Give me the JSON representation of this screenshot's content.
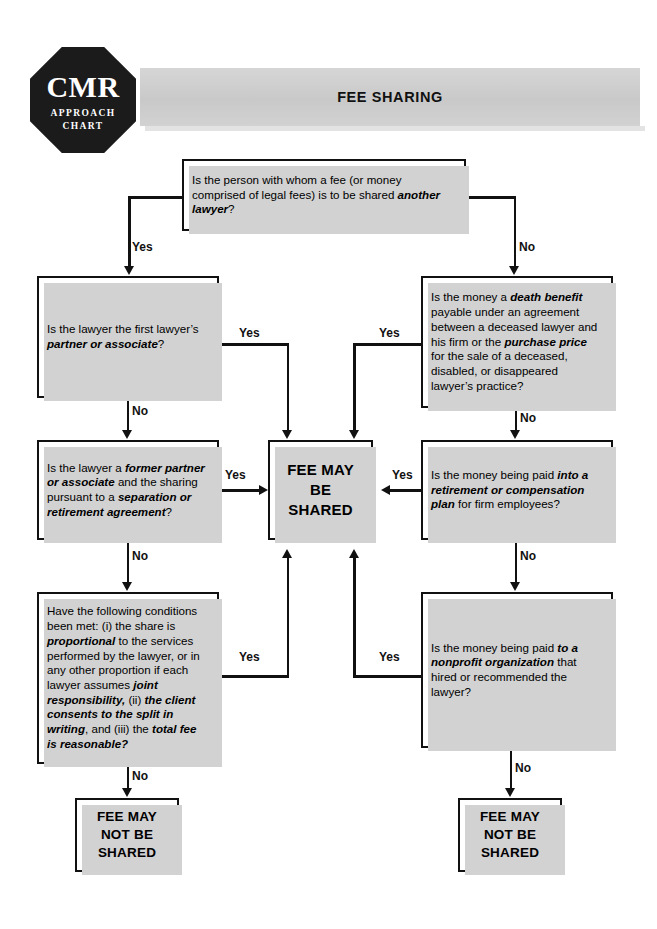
{
  "header": {
    "title": "FEE SHARING",
    "logo": {
      "brand": "CMR",
      "line1": "APPROACH",
      "line2": "CHART"
    }
  },
  "nodes": {
    "q_top": {
      "id": "another-lawyer",
      "parts": [
        {
          "t": "Is the person with whom a fee (or money comprised of legal fees) is to be shared ",
          "b": false
        },
        {
          "t": "another lawyer",
          "b": true
        },
        {
          "t": "?",
          "b": false
        }
      ]
    },
    "q_left_1": {
      "id": "partner-or-associate",
      "parts": [
        {
          "t": "Is the lawyer the first lawyer’s ",
          "b": false
        },
        {
          "t": "partner or associate",
          "b": true
        },
        {
          "t": "?",
          "b": false
        }
      ]
    },
    "q_left_2": {
      "id": "former-partner-separation-agreement",
      "parts": [
        {
          "t": "Is the lawyer a ",
          "b": false
        },
        {
          "t": "former partner or associate",
          "b": true
        },
        {
          "t": " and the sharing pursuant to a ",
          "b": false
        },
        {
          "t": "separation or retirement agreement",
          "b": true
        },
        {
          "t": "?",
          "b": false
        }
      ]
    },
    "q_left_3": {
      "id": "conditions-met",
      "parts": [
        {
          "t": "Have the following conditions been met: (i) the share is ",
          "b": false
        },
        {
          "t": "proportional",
          "b": true
        },
        {
          "t": " to the services performed by the lawyer, or in any other proportion if each lawyer assumes ",
          "b": false
        },
        {
          "t": "joint responsibility,",
          "b": true
        },
        {
          "t": " (ii) ",
          "b": false
        },
        {
          "t": "the client consents to the split in writing",
          "b": true
        },
        {
          "t": ", and (iii)  the ",
          "b": false
        },
        {
          "t": "total fee is reasonable?",
          "b": true
        }
      ]
    },
    "q_right_1": {
      "id": "death-benefit-purchase-price",
      "parts": [
        {
          "t": "Is the money a ",
          "b": false
        },
        {
          "t": "death benefit",
          "b": true
        },
        {
          "t": " payable under an agreement between a deceased lawyer and his firm or the ",
          "b": false
        },
        {
          "t": "purchase price",
          "b": true
        },
        {
          "t": " for the sale of a deceased, disabled, or disappeared lawyer’s practice?",
          "b": false
        }
      ]
    },
    "q_right_2": {
      "id": "retirement-compensation-plan",
      "parts": [
        {
          "t": "Is the money being paid ",
          "b": false
        },
        {
          "t": "into a retirement or compensation plan",
          "b": true
        },
        {
          "t": " for firm employees?",
          "b": false
        }
      ]
    },
    "q_right_3": {
      "id": "nonprofit-organization",
      "parts": [
        {
          "t": "Is the money being paid ",
          "b": false
        },
        {
          "t": "to a nonprofit organization",
          "b": true
        },
        {
          "t": " that hired or recommended the lawyer?",
          "b": false
        }
      ]
    },
    "result_shared": {
      "id": "fee-may-be-shared",
      "text": "FEE MAY BE SHARED"
    },
    "result_not_shared_left": {
      "id": "fee-may-not-be-shared-left",
      "text": "FEE MAY NOT BE SHARED"
    },
    "result_not_shared_right": {
      "id": "fee-may-not-be-shared-right",
      "text": "FEE MAY NOT BE SHARED"
    }
  },
  "edge_labels": {
    "top_yes": "Yes",
    "top_no": "No",
    "left1_yes": "Yes",
    "left1_no": "No",
    "left2_yes": "Yes",
    "left2_no": "No",
    "left3_yes": "Yes",
    "left3_no": "No",
    "right1_yes": "Yes",
    "right1_no": "No",
    "right2_yes": "Yes",
    "right2_no": "No",
    "right3_yes": "Yes",
    "right3_no": "No"
  },
  "colors": {
    "ink": "#111111",
    "banner": "#cfcfcf",
    "shadow": "#d2d2d2",
    "paper": "#ffffff"
  }
}
